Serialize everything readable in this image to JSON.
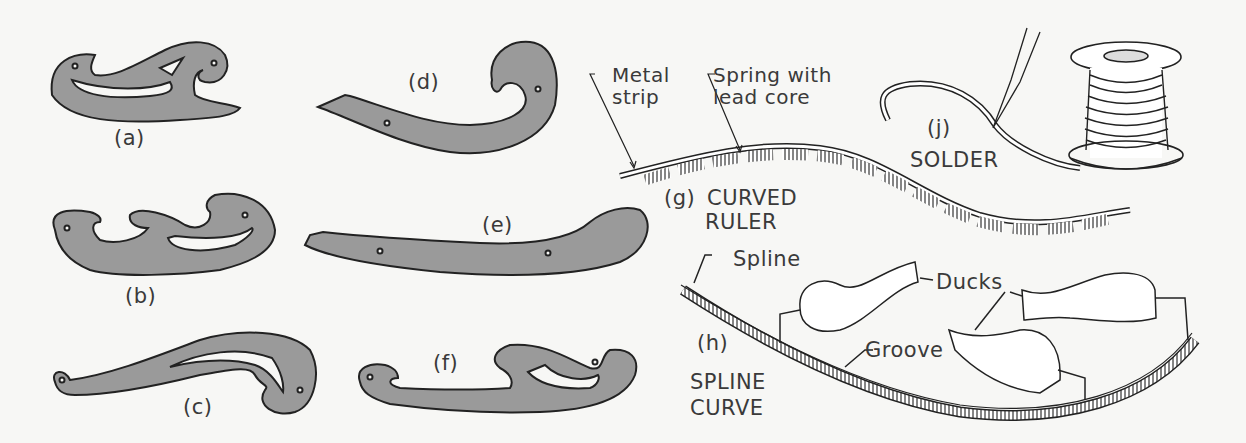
{
  "figure": {
    "colors": {
      "background": "#f7f7f5",
      "curve_fill": "#9a9a9a",
      "outline": "#222222",
      "text": "#3a3a3a"
    },
    "french_curves": [
      {
        "id": "a",
        "label": "(a)"
      },
      {
        "id": "b",
        "label": "(b)"
      },
      {
        "id": "c",
        "label": "(c)"
      },
      {
        "id": "d",
        "label": "(d)"
      },
      {
        "id": "e",
        "label": "(e)"
      },
      {
        "id": "f",
        "label": "(f)"
      }
    ],
    "curved_ruler": {
      "id": "g",
      "label_id": "(g)",
      "label_line1": "CURVED",
      "label_line2": "RULER",
      "callouts": {
        "metal_strip": "Metal\nstrip",
        "spring": "Spring with\nlead core"
      }
    },
    "solder": {
      "id": "j",
      "label_id": "(j)",
      "label": "SOLDER"
    },
    "spline_curve": {
      "id": "h",
      "label_id": "(h)",
      "label_line1": "SPLINE",
      "label_line2": "CURVE",
      "callouts": {
        "spline": "Spline",
        "ducks": "Ducks",
        "groove": "Groove"
      }
    }
  }
}
